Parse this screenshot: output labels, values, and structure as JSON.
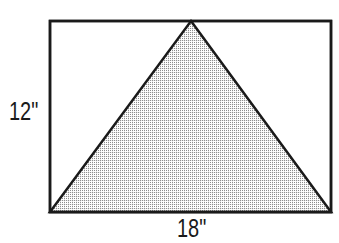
{
  "figure": {
    "kind": "geometry-diagram",
    "background_color": "#ffffff",
    "outline_color": "#1a1a1a",
    "fill_pattern_color": "#8c8c8c",
    "fill_pattern": "fine-dotted-grid",
    "rectangle": {
      "x": 50,
      "y": 21,
      "width": 281,
      "height": 191,
      "stroke_width": 2.5
    },
    "triangle": {
      "apex": {
        "x": 191,
        "y": 21
      },
      "base_left": {
        "x": 50,
        "y": 212
      },
      "base_right": {
        "x": 331,
        "y": 212
      },
      "stroke_width": 2.5,
      "shaded": true
    },
    "labels": {
      "height": "12\"",
      "width": "18\""
    },
    "measurements": {
      "height_value": 12,
      "width_value": 18,
      "units": "inches"
    }
  }
}
